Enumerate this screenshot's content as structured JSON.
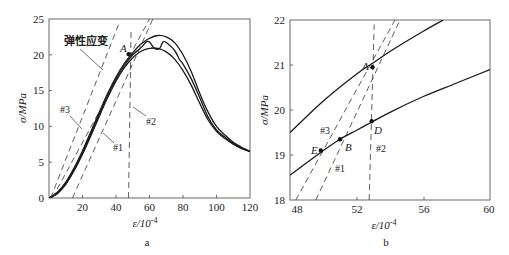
{
  "chart_data": [
    {
      "id": "a",
      "type": "line",
      "caption": "a",
      "xlabel": "ε/10⁻⁴",
      "ylabel": "σ/MPa",
      "xlim": [
        0,
        120
      ],
      "ylim": [
        0,
        25
      ],
      "xticks": [
        20,
        40,
        60,
        80,
        100,
        120
      ],
      "yticks": [
        0,
        5,
        10,
        15,
        20,
        25
      ],
      "grid": false,
      "series": [
        {
          "name": "upper envelope",
          "style": "solid",
          "x": [
            0,
            5,
            10,
            15,
            20,
            25,
            30,
            35,
            40,
            45,
            50,
            55,
            60,
            65,
            70,
            75,
            80,
            85,
            90,
            95,
            100,
            105,
            110,
            115,
            120
          ],
          "y": [
            0,
            0.8,
            2.2,
            4.2,
            6.6,
            9.3,
            12.0,
            14.6,
            16.9,
            18.8,
            20.3,
            21.5,
            22.3,
            22.7,
            22.5,
            21.7,
            20.0,
            17.6,
            14.6,
            12.0,
            10.0,
            8.8,
            7.8,
            7.1,
            6.5
          ]
        },
        {
          "name": "lower envelope",
          "style": "solid",
          "x": [
            0,
            5,
            10,
            15,
            20,
            25,
            30,
            35,
            40,
            45,
            50,
            55,
            60,
            65,
            70,
            75,
            80,
            85,
            90,
            95,
            100,
            105,
            110,
            115,
            120
          ],
          "y": [
            0,
            0.6,
            1.9,
            3.8,
            6.1,
            8.7,
            11.4,
            14.0,
            16.3,
            18.2,
            19.6,
            20.5,
            20.9,
            20.9,
            20.4,
            19.4,
            17.8,
            15.7,
            13.2,
            10.9,
            9.3,
            8.3,
            7.5,
            6.9,
            6.5
          ]
        },
        {
          "name": "middle (stepped)",
          "style": "solid",
          "x": [
            0,
            5,
            10,
            15,
            20,
            25,
            30,
            35,
            40,
            45,
            50,
            55,
            58,
            60,
            63,
            66,
            68,
            70,
            75,
            78,
            80,
            85,
            90,
            95,
            100,
            105,
            110,
            115,
            120
          ],
          "y": [
            0,
            0.7,
            2.0,
            4.0,
            6.3,
            9.0,
            11.7,
            14.3,
            16.6,
            18.5,
            20.0,
            21.0,
            21.8,
            21.8,
            20.9,
            20.9,
            21.8,
            21.7,
            20.6,
            19.3,
            18.7,
            16.6,
            14.0,
            11.3,
            9.5,
            8.5,
            7.6,
            7.0,
            6.5
          ]
        }
      ],
      "reference_lines": [
        {
          "name": "弹性应变",
          "style": "dashed",
          "x": [
            1,
            42
          ],
          "y": [
            0,
            24.5
          ]
        },
        {
          "name": "#3",
          "style": "dashed",
          "x": [
            2,
            60
          ],
          "y": [
            0,
            25
          ]
        },
        {
          "name": "#1",
          "style": "dashed",
          "x": [
            14,
            62
          ],
          "y": [
            0,
            25
          ]
        },
        {
          "name": "#2",
          "style": "dashed",
          "x": [
            47.5,
            49
          ],
          "y": [
            0,
            23.5
          ]
        }
      ],
      "annotations": [
        {
          "text": "弹性应变",
          "x": 22,
          "y": 22.6
        },
        {
          "text": "A",
          "x": 42,
          "y": 20.8,
          "italic": true
        },
        {
          "text": "#3",
          "x": 12,
          "y": 11.7
        },
        {
          "text": "#1",
          "x": 38,
          "y": 7.3
        },
        {
          "text": "#2",
          "x": 57,
          "y": 8.8
        }
      ],
      "points": [
        {
          "label": "A",
          "x": 47.5,
          "y": 20.1
        }
      ]
    },
    {
      "id": "b",
      "type": "line",
      "caption": "b",
      "xlabel": "ε/10⁻⁴",
      "ylabel": "σ/MPa",
      "xlim": [
        48,
        60
      ],
      "ylim": [
        18,
        22
      ],
      "xticks": [
        48,
        52,
        56,
        60
      ],
      "yticks": [
        18,
        19,
        20,
        21,
        22
      ],
      "grid": false,
      "series": [
        {
          "name": "upper curve",
          "style": "solid",
          "x": [
            48,
            50,
            52,
            53,
            54,
            56,
            57.2
          ],
          "y": [
            19.5,
            20.2,
            20.8,
            21.05,
            21.3,
            21.75,
            22.0
          ]
        },
        {
          "name": "lower curve",
          "style": "solid",
          "x": [
            48,
            50,
            51,
            52,
            53,
            54,
            56,
            58,
            60
          ],
          "y": [
            18.55,
            19.1,
            19.35,
            19.55,
            19.75,
            19.95,
            20.3,
            20.6,
            20.9
          ]
        }
      ],
      "reference_lines": [
        {
          "name": "#3",
          "style": "dashed",
          "x": [
            48.35,
            54.3
          ],
          "y": [
            18,
            22
          ]
        },
        {
          "name": "#1",
          "style": "dashed",
          "x": [
            49.55,
            54.6
          ],
          "y": [
            18,
            22
          ]
        },
        {
          "name": "#2",
          "style": "dashed",
          "x": [
            52.75,
            53.05
          ],
          "y": [
            18,
            21.9
          ]
        }
      ],
      "annotations": [
        {
          "text": "A",
          "x": 52.45,
          "y": 21.0,
          "italic": true
        },
        {
          "text": "B",
          "x": 51.25,
          "y": 19.1,
          "italic": true
        },
        {
          "text": "D",
          "x": 53.0,
          "y": 19.5,
          "italic": true
        },
        {
          "text": "E",
          "x": 49.3,
          "y": 19.0,
          "italic": true
        },
        {
          "text": "#3",
          "x": 49.6,
          "y": 19.55
        },
        {
          "text": "#1",
          "x": 50.8,
          "y": 18.5
        },
        {
          "text": "#2",
          "x": 53.1,
          "y": 19.0
        }
      ],
      "points": [
        {
          "label": "A",
          "x": 52.95,
          "y": 20.95
        },
        {
          "label": "B",
          "x": 51.0,
          "y": 19.35
        },
        {
          "label": "D",
          "x": 52.9,
          "y": 19.75
        },
        {
          "label": "E",
          "x": 49.85,
          "y": 19.1
        }
      ]
    }
  ],
  "labels": {
    "a": {
      "ylabel": "σ/MPa",
      "xlabel_base": "ε/10",
      "xlabel_exp": "-4",
      "caption": "a",
      "elastic": "弹性应变",
      "A": "A",
      "n1": "#1",
      "n2": "#2",
      "n3": "#3",
      "yt": [
        "0",
        "5",
        "10",
        "15",
        "20",
        "25"
      ],
      "xt": [
        "20",
        "40",
        "60",
        "80",
        "100",
        "120"
      ]
    },
    "b": {
      "ylabel": "σ/MPa",
      "xlabel_base": "ε/10",
      "xlabel_exp": "-4",
      "caption": "b",
      "A": "A",
      "B": "B",
      "D": "D",
      "E": "E",
      "n1": "#1",
      "n2": "#2",
      "n3": "#3",
      "yt": [
        "18",
        "19",
        "20",
        "21",
        "22"
      ],
      "xt": [
        "48",
        "52",
        "56",
        "60"
      ]
    }
  }
}
